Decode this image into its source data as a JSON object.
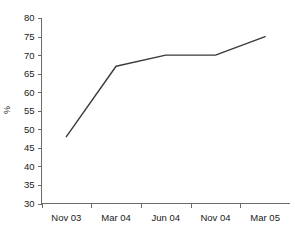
{
  "chart_data": {
    "type": "line",
    "title": "",
    "subtitle": "",
    "xlabel": "",
    "ylabel": "%",
    "categories": [
      "Nov 03",
      "Mar 04",
      "Jun 04",
      "Nov 04",
      "Mar 05"
    ],
    "values": [
      48,
      67,
      70,
      70,
      75
    ],
    "series": [
      {
        "name": "%",
        "values": [
          48,
          67,
          70,
          70,
          75
        ]
      }
    ],
    "ylim": [
      30,
      80
    ],
    "yticks": [
      30,
      35,
      40,
      45,
      50,
      55,
      60,
      65,
      70,
      75,
      80
    ],
    "ytick_labels": [
      "30",
      "35",
      "40",
      "45",
      "50",
      "55",
      "60",
      "65",
      "70",
      "75",
      "80"
    ],
    "xtick_labels": [
      "Nov 03",
      "Mar 04",
      "Jun 04",
      "Nov 04",
      "Mar 05"
    ],
    "grid": false,
    "legend": false,
    "legend_position": "none",
    "line_color": "#3a3a3a",
    "axis_color": "#6b6b6b",
    "text_color": "#1a1a1a",
    "background_color": "#ffffff",
    "markers": false,
    "annotations": []
  }
}
